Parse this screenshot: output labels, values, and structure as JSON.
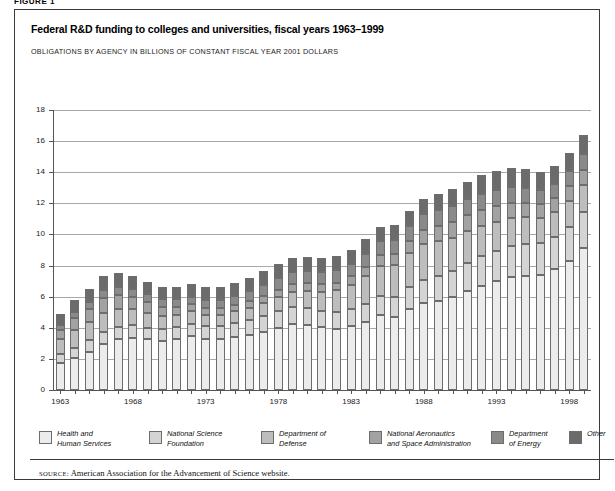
{
  "figure": {
    "label": "FIGURE 1",
    "title": "Federal R&D funding to colleges and universities, fiscal years 1963–1999",
    "subtitle": "OBLIGATIONS BY AGENCY IN BILLIONS OF CONSTANT FISCAL YEAR 2001 DOLLARS",
    "source_label": "SOURCE:",
    "source_text": "American Association for the Advancement of Science website."
  },
  "legend": {
    "position": "bottom",
    "items": [
      {
        "label_line1": "Health and",
        "label_line2": "Human Services",
        "color": "#ececec"
      },
      {
        "label_line1": "National Science",
        "label_line2": "Foundation",
        "color": "#d4d4d4"
      },
      {
        "label_line1": "Department of",
        "label_line2": "Defense",
        "color": "#bdbdbd"
      },
      {
        "label_line1": "National Aeronautics",
        "label_line2": "and Space Administration",
        "color": "#a2a2a2"
      },
      {
        "label_line1": "Department",
        "label_line2": "of Energy",
        "color": "#8a8a8a"
      },
      {
        "label_line1": "Other",
        "label_line2": "",
        "color": "#6b6b6b"
      }
    ]
  },
  "chart_data": {
    "type": "bar",
    "stacked": true,
    "title": "Federal R&D funding to colleges and universities, fiscal years 1963–1999",
    "subtitle": "OBLIGATIONS BY AGENCY IN BILLIONS OF CONSTANT FISCAL YEAR 2001 DOLLARS",
    "xlabel": "",
    "ylabel": "",
    "ylim": [
      0,
      18
    ],
    "yticks": [
      0,
      2,
      4,
      6,
      8,
      10,
      12,
      14,
      16,
      18
    ],
    "grid": true,
    "xtick_labels": [
      "1963",
      "1968",
      "1973",
      "1978",
      "1983",
      "1988",
      "1993",
      "1998"
    ],
    "categories": [
      "1963",
      "1964",
      "1965",
      "1966",
      "1967",
      "1968",
      "1969",
      "1970",
      "1971",
      "1972",
      "1973",
      "1974",
      "1975",
      "1976",
      "1977",
      "1978",
      "1979",
      "1980",
      "1981",
      "1982",
      "1983",
      "1984",
      "1985",
      "1986",
      "1987",
      "1988",
      "1989",
      "1990",
      "1991",
      "1992",
      "1993",
      "1994",
      "1995",
      "1996",
      "1997",
      "1998",
      "1999"
    ],
    "series": [
      {
        "name": "Health and Human Services",
        "color": "#ececec",
        "values": [
          1.75,
          2.05,
          2.45,
          2.95,
          3.25,
          3.35,
          3.25,
          3.15,
          3.3,
          3.45,
          3.25,
          3.25,
          3.4,
          3.55,
          3.75,
          4.0,
          4.25,
          4.2,
          4.05,
          3.95,
          4.1,
          4.4,
          4.8,
          4.7,
          5.2,
          5.6,
          5.75,
          5.95,
          6.35,
          6.7,
          7.0,
          7.25,
          7.35,
          7.4,
          7.75,
          8.3,
          9.1
        ]
      },
      {
        "name": "National Science Foundation",
        "color": "#d4d4d4",
        "values": [
          0.55,
          0.65,
          0.75,
          0.8,
          0.8,
          0.8,
          0.75,
          0.75,
          0.75,
          0.8,
          0.85,
          0.85,
          0.9,
          0.95,
          1.0,
          1.05,
          1.1,
          1.1,
          1.05,
          1.05,
          1.1,
          1.15,
          1.25,
          1.3,
          1.4,
          1.5,
          1.6,
          1.7,
          1.8,
          1.9,
          1.95,
          2.0,
          2.05,
          2.05,
          2.1,
          2.2,
          2.35
        ]
      },
      {
        "name": "Department of Defense",
        "color": "#bdbdbd",
        "values": [
          0.95,
          1.15,
          1.15,
          1.2,
          1.15,
          1.05,
          0.95,
          0.85,
          0.8,
          0.8,
          0.75,
          0.75,
          0.75,
          0.8,
          0.85,
          0.9,
          0.95,
          1.05,
          1.2,
          1.4,
          1.55,
          1.75,
          1.95,
          2.05,
          2.2,
          2.3,
          2.25,
          2.15,
          2.05,
          1.95,
          1.85,
          1.8,
          1.7,
          1.6,
          1.6,
          1.65,
          1.7
        ]
      },
      {
        "name": "National Aeronautics and Space Administration",
        "color": "#a2a2a2",
        "values": [
          0.6,
          0.75,
          0.85,
          0.95,
          0.9,
          0.8,
          0.7,
          0.6,
          0.5,
          0.45,
          0.4,
          0.4,
          0.4,
          0.4,
          0.45,
          0.5,
          0.5,
          0.5,
          0.5,
          0.5,
          0.55,
          0.6,
          0.65,
          0.7,
          0.8,
          0.9,
          0.95,
          1.0,
          1.05,
          1.05,
          1.05,
          1.0,
          0.95,
          0.9,
          0.9,
          0.95,
          1.0
        ]
      },
      {
        "name": "Department of Energy",
        "color": "#8a8a8a",
        "values": [
          0.35,
          0.4,
          0.45,
          0.5,
          0.5,
          0.5,
          0.5,
          0.5,
          0.5,
          0.5,
          0.55,
          0.55,
          0.6,
          0.65,
          0.7,
          0.75,
          0.8,
          0.8,
          0.8,
          0.8,
          0.8,
          0.85,
          0.9,
          0.9,
          0.95,
          1.0,
          1.0,
          1.0,
          1.0,
          1.0,
          1.0,
          1.0,
          0.95,
          0.9,
          0.9,
          0.95,
          1.0
        ]
      },
      {
        "name": "Other",
        "color": "#6b6b6b",
        "values": [
          0.7,
          0.8,
          0.85,
          0.9,
          0.9,
          0.85,
          0.8,
          0.8,
          0.8,
          0.8,
          0.8,
          0.8,
          0.85,
          0.85,
          0.9,
          0.9,
          0.9,
          0.9,
          0.9,
          0.9,
          0.9,
          0.95,
          0.95,
          0.95,
          0.95,
          1.0,
          1.05,
          1.1,
          1.15,
          1.2,
          1.2,
          1.2,
          1.2,
          1.15,
          1.15,
          1.2,
          1.25
        ]
      }
    ]
  }
}
